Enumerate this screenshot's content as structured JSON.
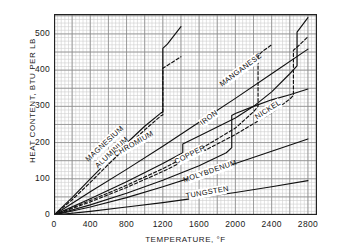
{
  "chart_data": {
    "type": "line",
    "title": "",
    "xlabel": "TEMPERATURE, °F",
    "ylabel": "HEAT CONTENT, BTU PER LB",
    "xlim": [
      0,
      2900
    ],
    "ylim": [
      0,
      555
    ],
    "xticks": [
      0,
      400,
      800,
      1200,
      1600,
      2000,
      2400,
      2800
    ],
    "xtick_labels": [
      "0",
      "400",
      "800",
      "1200",
      "1600",
      "2000",
      "2400",
      "2800"
    ],
    "yticks": [
      0,
      100,
      200,
      300,
      400,
      500
    ],
    "ytick_labels": [
      "0",
      "100",
      "200",
      "300",
      "400",
      "500"
    ],
    "grid": "both",
    "grid_minor_x_step": 40,
    "grid_major_x_step": 200,
    "grid_minor_y_step": 10,
    "grid_major_y_step": 50,
    "legend": "inline-curve-labels",
    "series": [
      {
        "name": "MAGNESIUM",
        "style": "solid",
        "label_x": 560,
        "label_y": 196,
        "label_angle": -43,
        "points": [
          [
            0,
            0
          ],
          [
            200,
            48
          ],
          [
            400,
            100
          ],
          [
            600,
            150
          ],
          [
            800,
            198
          ],
          [
            1000,
            245
          ],
          [
            1180,
            282
          ],
          [
            1200,
            284
          ],
          [
            1200,
            460
          ],
          [
            1250,
            472
          ],
          [
            1400,
            520
          ]
        ]
      },
      {
        "name": "ALUMINUM",
        "style": "dashed",
        "label_x": 640,
        "label_y": 172,
        "label_angle": -43,
        "points": [
          [
            0,
            0
          ],
          [
            200,
            42
          ],
          [
            400,
            90
          ],
          [
            600,
            140
          ],
          [
            800,
            188
          ],
          [
            1000,
            235
          ],
          [
            1180,
            274
          ],
          [
            1200,
            276
          ],
          [
            1200,
            405
          ],
          [
            1250,
            413
          ],
          [
            1400,
            437
          ]
        ]
      },
      {
        "name": "CHROMIUM",
        "style": "solid",
        "label_x": 880,
        "label_y": 196,
        "label_angle": -30,
        "points": [
          [
            0,
            0
          ],
          [
            400,
            64
          ],
          [
            800,
            126
          ],
          [
            1200,
            190
          ],
          [
            1600,
            256
          ],
          [
            2000,
            322
          ],
          [
            2400,
            390
          ],
          [
            2800,
            458
          ]
        ]
      },
      {
        "name": "IRON",
        "style": "solid",
        "label_x": 1710,
        "label_y": 268,
        "label_angle": -37,
        "points": [
          [
            0,
            0
          ],
          [
            400,
            45
          ],
          [
            800,
            92
          ],
          [
            1200,
            142
          ],
          [
            1420,
            172
          ],
          [
            1420,
            196
          ],
          [
            1600,
            218
          ],
          [
            1800,
            243
          ],
          [
            2000,
            268
          ],
          [
            2200,
            300
          ],
          [
            2400,
            340
          ],
          [
            2600,
            390
          ],
          [
            2680,
            412
          ],
          [
            2680,
            505
          ],
          [
            2800,
            545
          ]
        ]
      },
      {
        "name": "MANGANESE",
        "style": "dashed",
        "label_x": 2060,
        "label_y": 400,
        "label_angle": -37,
        "points": [
          [
            0,
            0
          ],
          [
            400,
            40
          ],
          [
            800,
            82
          ],
          [
            1200,
            128
          ],
          [
            1600,
            180
          ],
          [
            2000,
            240
          ],
          [
            2200,
            285
          ],
          [
            2250,
            300
          ],
          [
            2250,
            440
          ],
          [
            2300,
            452
          ],
          [
            2400,
            470
          ]
        ]
      },
      {
        "name": "NICKEL",
        "style": "dashed",
        "label_x": 2360,
        "label_y": 290,
        "label_angle": -33,
        "points": [
          [
            0,
            0
          ],
          [
            400,
            36
          ],
          [
            800,
            76
          ],
          [
            1200,
            120
          ],
          [
            1600,
            170
          ],
          [
            2000,
            222
          ],
          [
            2400,
            282
          ],
          [
            2600,
            320
          ],
          [
            2640,
            330
          ],
          [
            2640,
            455
          ],
          [
            2700,
            468
          ],
          [
            2800,
            492
          ]
        ]
      },
      {
        "name": "COPPER",
        "style": "solid",
        "label_x": 1500,
        "label_y": 166,
        "label_angle": -27,
        "points": [
          [
            0,
            0
          ],
          [
            400,
            28
          ],
          [
            800,
            60
          ],
          [
            1200,
            96
          ],
          [
            1600,
            136
          ],
          [
            1900,
            172
          ],
          [
            1960,
            186
          ],
          [
            1960,
            275
          ],
          [
            2000,
            280
          ],
          [
            2200,
            300
          ],
          [
            2400,
            318
          ],
          [
            2600,
            332
          ],
          [
            2800,
            348
          ]
        ]
      },
      {
        "name": "MOLYBDENUM",
        "style": "solid",
        "label_x": 1720,
        "label_y": 120,
        "label_angle": -19,
        "points": [
          [
            0,
            0
          ],
          [
            400,
            22
          ],
          [
            800,
            48
          ],
          [
            1200,
            78
          ],
          [
            1600,
            110
          ],
          [
            2000,
            142
          ],
          [
            2400,
            176
          ],
          [
            2800,
            210
          ]
        ]
      },
      {
        "name": "TUNGSTEN",
        "style": "solid",
        "label_x": 1690,
        "label_y": 62,
        "label_angle": -10,
        "points": [
          [
            0,
            0
          ],
          [
            400,
            10
          ],
          [
            800,
            22
          ],
          [
            1200,
            34
          ],
          [
            1600,
            48
          ],
          [
            2000,
            62
          ],
          [
            2400,
            78
          ],
          [
            2800,
            95
          ]
        ]
      }
    ]
  },
  "colors": {
    "ink": "#111111",
    "grid_minor": "#cfcfcf",
    "grid_major": "#8a8a8a",
    "frame": "#222222",
    "background": "#ffffff"
  }
}
